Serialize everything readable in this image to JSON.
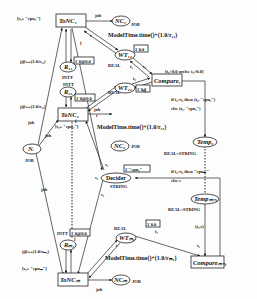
{
  "diagram": {
    "type": "colored-petri-net",
    "transitions": {
      "tonc1": "ToNC₁",
      "tonc2": "ToNC₂",
      "toncm": "ToNCₘ",
      "compare1": "Compare₁",
      "compare_m1": "Compareₘ₋₁"
    },
    "places": {
      "ni": "Nᵢ",
      "ni_type": "JOB",
      "nc1": "NC₁",
      "nc1_type": "JOB",
      "nc2": "NC₂",
      "nc2_type": "JOB",
      "ncm": "NCₘ",
      "ncm_type": "JOB",
      "r11": "R₁₁",
      "r11_type": "INTT",
      "r11_init": "1`0@0.0",
      "r21": "R₂₁",
      "r21_type": "INTT",
      "r21_init": "1`0@0.0",
      "rm1": "Rₘ₁",
      "rm1_type": "INTT",
      "rm1_init": "1`0@0.0",
      "wt11": "WT₁₁",
      "wt11_type": "REAL",
      "wt11_init": "1`0.0",
      "wt21": "WT₂₁",
      "wt21_type": "REAL",
      "wt21_init": "1`0.0",
      "wtm1": "WTₘ₁",
      "wtm1_type": "REAL",
      "wtm1_init": "1`0.0",
      "temp1": "Temp₁",
      "temp1_type": "REAL×STRING",
      "tempm1": "Tempₘ₋₁",
      "tempm1_type": "REAL×STRING",
      "decider": "Decider",
      "decider_type": "STRING",
      "decider_init": "1`\"cpu₁\""
    },
    "guards": {
      "tonc1": "[s₁= \"cpu₁\"]",
      "tonc2": "[s₁= \"cpu₂\"]",
      "toncm": "[s₁= \"cpuₘ\"]",
      "compare1": "[t₁>0.0 orelse t₂>0.0]"
    },
    "arc_labels": {
      "job": "job",
      "j": "j",
      "t": "t",
      "t1": "t₁",
      "t2": "t₂",
      "s1": "s₁",
      "j_inc_11": "j@++(1.0/r₁₁)",
      "j_inc_21": "j@++(1.0/r₂₁)",
      "j_inc_m1": "j@++(1.0/rₘ₁)",
      "model_time_11": "ModelTime.time()+(1.0/r₁₁)",
      "model_time_21": "ModelTime.time()+(1.0/r₂₁)",
      "model_time_m1": "ModelTime.time()+(1.0/rₘ₁)",
      "compare1_out_a": "if t₁>t₂ then (t₂, \"cpu₂\")",
      "compare1_out_b": "else (t₁, \"cpu₁\")",
      "decider_in_a": "if t₁>t₂ then \"cpuₘ\"",
      "decider_in_b": "else s",
      "temp_m1_out": "(t₁,s)"
    }
  }
}
